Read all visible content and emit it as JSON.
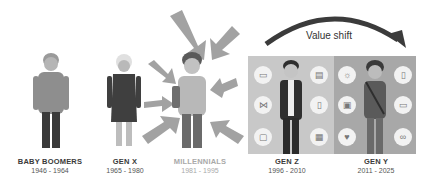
{
  "title_arrow": {
    "label": "Value shift"
  },
  "generations": [
    {
      "name": "BABY BOOMERS",
      "years": "1946 - 1964"
    },
    {
      "name": "GEN X",
      "years": "1965 - 1980"
    },
    {
      "name": "MILLENNIALS",
      "years": "1981 - 1995"
    },
    {
      "name": "GEN Z",
      "years": "1996 - 2010"
    },
    {
      "name": "GEN Y",
      "years": "2011 - 2025"
    }
  ],
  "panels": {
    "gen_z_icons": [
      "tablet-icon",
      "network-icon",
      "tv-icon",
      "laptop-icon",
      "phone-icon",
      "chart-icon"
    ],
    "gen_y_icons": [
      "lightbulb-icon",
      "camera-icon",
      "heart-icon",
      "mobile-icon",
      "video-icon",
      "glasses-icon"
    ]
  },
  "colors": {
    "panel_z": "#c8c8c8",
    "panel_y": "#a8a8a8",
    "arrow": "#9a9a9a",
    "text_dark": "#3a3a3a",
    "text_muted": "#a9a9a9"
  }
}
